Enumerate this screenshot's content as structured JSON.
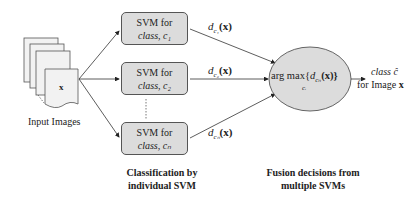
{
  "input": {
    "label": "Input Images",
    "doc_symbol": "x"
  },
  "svms": [
    {
      "line1": "SVM for",
      "line2": "class, c₁",
      "decision": "d",
      "decision_sub": "c₁",
      "decision_arg": "(x)"
    },
    {
      "line1": "SVM for",
      "line2": "class, c₂",
      "decision": "d",
      "decision_sub": "c₂",
      "decision_arg": "(x)"
    },
    {
      "line1": "SVM for",
      "line2": "class, cₙ",
      "decision": "d",
      "decision_sub": "cₙ",
      "decision_arg": "(x)"
    }
  ],
  "fusion": {
    "expr_prefix": "arg max{",
    "expr_d": "d",
    "expr_sub": "cₙ",
    "expr_suffix": "(x)}",
    "under": "cᵢ"
  },
  "output": {
    "line1": "class ĉ",
    "line2_prefix": "for Image ",
    "line2_bold": "x"
  },
  "captions": {
    "left_line1": "Classification by",
    "left_line2": "individual SVM",
    "right_line1": "Fusion decisions from",
    "right_line2": "multiple SVMs"
  },
  "colors": {
    "box_fill": "#dcdcdc",
    "ellipse_fill": "#dcdcdc",
    "stroke": "#555555",
    "paper_fill": "#f2f2f2"
  }
}
